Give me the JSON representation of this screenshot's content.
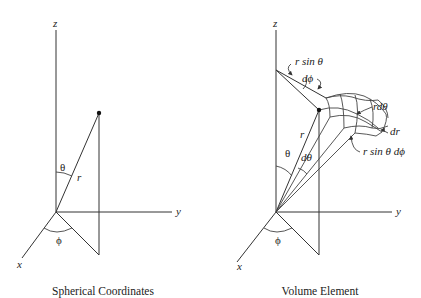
{
  "left_diagram": {
    "caption": "Spherical Coordinates",
    "axis_labels": {
      "z": "z",
      "y": "y",
      "x": "x"
    },
    "angle_labels": {
      "theta": "θ",
      "phi": "ϕ"
    },
    "radius_label": "r"
  },
  "right_diagram": {
    "caption": "Volume Element",
    "axis_labels": {
      "z": "z",
      "y": "y",
      "x": "x"
    },
    "angle_labels": {
      "theta": "θ",
      "phi": "ϕ",
      "dtheta": "dθ"
    },
    "radius_label": "r",
    "annotations": {
      "r_sin_theta": "r sin θ",
      "dphi": "dϕ",
      "r_dtheta": "rdθ",
      "dr": "dr",
      "r_sin_theta_dphi": "r sin θ dϕ"
    }
  }
}
